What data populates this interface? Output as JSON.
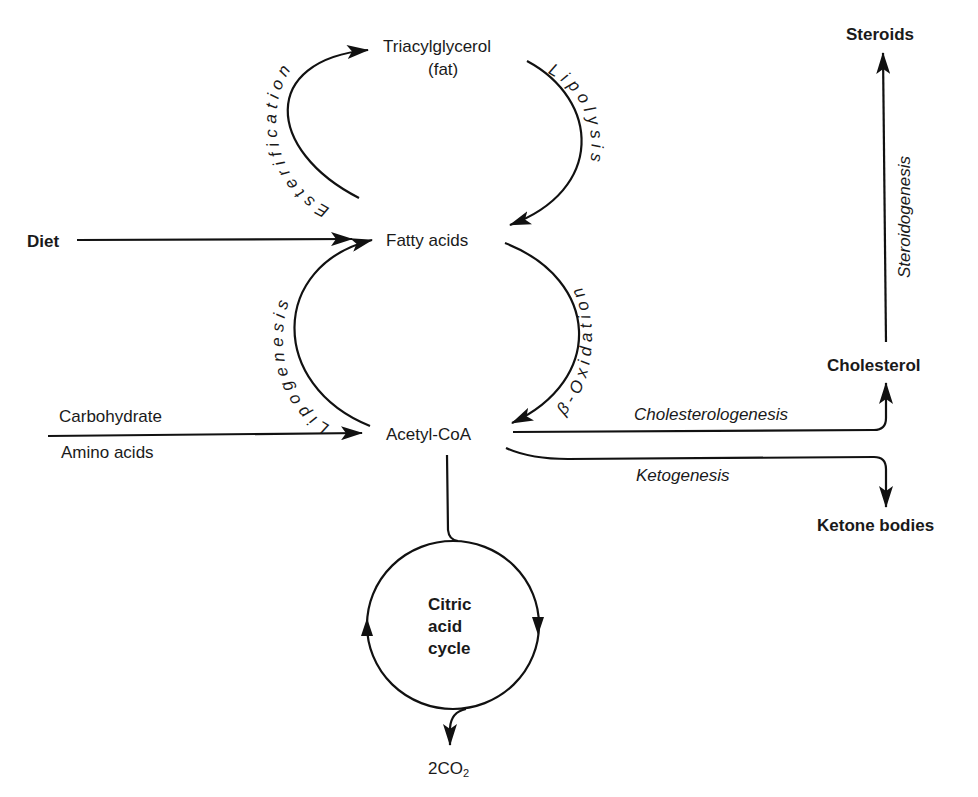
{
  "diagram": {
    "nodes": {
      "triacylglycerol": "Triacylglycerol",
      "fat": "(fat)",
      "fatty_acids": "Fatty acids",
      "acetyl_coa": "Acetyl-CoA",
      "diet": "Diet",
      "carbohydrate": "Carbohydrate",
      "amino_acids": "Amino acids",
      "steroids": "Steroids",
      "cholesterol": "Cholesterol",
      "ketone_bodies": "Ketone bodies",
      "citric_1": "Citric",
      "citric_2": "acid",
      "citric_3": "cycle",
      "co2": "2CO",
      "co2_sub": "2"
    },
    "processes": {
      "esterification": "Esterification",
      "lipolysis": "Lipolysis",
      "lipogenesis": "Lipogenesis",
      "beta_oxidation": "β-Oxidation",
      "cholesterologenesis": "Cholesterologenesis",
      "ketogenesis": "Ketogenesis",
      "steroidogenesis": "Steroidogenesis"
    },
    "edges": [
      {
        "from": "Fatty acids",
        "to": "Triacylglycerol",
        "label": "Esterification"
      },
      {
        "from": "Triacylglycerol",
        "to": "Fatty acids",
        "label": "Lipolysis"
      },
      {
        "from": "Acetyl-CoA",
        "to": "Fatty acids",
        "label": "Lipogenesis"
      },
      {
        "from": "Fatty acids",
        "to": "Acetyl-CoA",
        "label": "β-Oxidation"
      },
      {
        "from": "Diet",
        "to": "Fatty acids",
        "label": ""
      },
      {
        "from": "Carbohydrate / Amino acids",
        "to": "Acetyl-CoA",
        "label": ""
      },
      {
        "from": "Acetyl-CoA",
        "to": "Cholesterol",
        "label": "Cholesterologenesis"
      },
      {
        "from": "Acetyl-CoA",
        "to": "Ketone bodies",
        "label": "Ketogenesis"
      },
      {
        "from": "Cholesterol",
        "to": "Steroids",
        "label": "Steroidogenesis"
      },
      {
        "from": "Acetyl-CoA",
        "to": "Citric acid cycle",
        "label": ""
      },
      {
        "from": "Citric acid cycle",
        "to": "2CO2",
        "label": ""
      }
    ]
  }
}
